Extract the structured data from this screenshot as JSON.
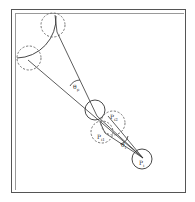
{
  "diagram": {
    "labels": {
      "theta_p": "θ",
      "theta_p_sub": "p",
      "theta_i": "θ",
      "theta_i_sub": "i",
      "p_i2": "P",
      "p_i2_sub": "i2",
      "p_i1": "P",
      "p_i1_sub": "i1",
      "p_i": "P",
      "p_i_sub": "i"
    },
    "colors": {
      "stroke": "#333333",
      "dashed": "#666666",
      "frame": "#555555"
    }
  }
}
